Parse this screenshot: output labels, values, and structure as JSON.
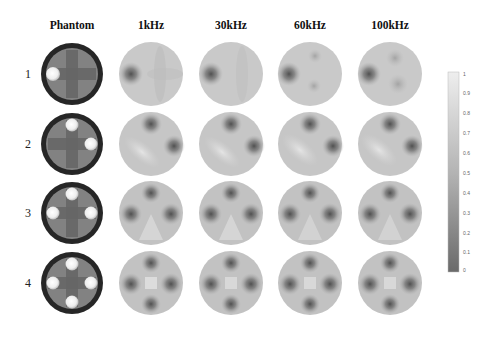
{
  "figure": {
    "columns": [
      {
        "key": "phantom",
        "label": "Phantom",
        "cx": 72
      },
      {
        "key": "1k",
        "label": "1kHz",
        "cx": 151
      },
      {
        "key": "30k",
        "label": "30kHz",
        "cx": 231
      },
      {
        "key": "60k",
        "label": "60kHz",
        "cx": 310
      },
      {
        "key": "100k",
        "label": "100kHz",
        "cx": 390
      }
    ],
    "rows": [
      {
        "label": "1",
        "cy": 74
      },
      {
        "label": "2",
        "cy": 144
      },
      {
        "label": "3",
        "cy": 213
      },
      {
        "label": "4",
        "cy": 283
      }
    ],
    "colorbar": {
      "min": 0,
      "max": 1,
      "ticks": [
        "1",
        "0.9",
        "0.8",
        "0.7",
        "0.6",
        "0.5",
        "0.4",
        "0.3",
        "0.2",
        "0.1",
        "0"
      ],
      "top_color": "#ececec",
      "bottom_color": "#6f6f6f"
    },
    "colors": {
      "phantom_ring": "#2a2a2a",
      "phantom_bg": "#7e7e7e",
      "phantom_cross": "#626262",
      "phantom_inclusion": "#f4f4f4",
      "recon_bg": "#c8c8c8",
      "recon_light": "#dedede",
      "recon_blob": "#505050"
    }
  }
}
